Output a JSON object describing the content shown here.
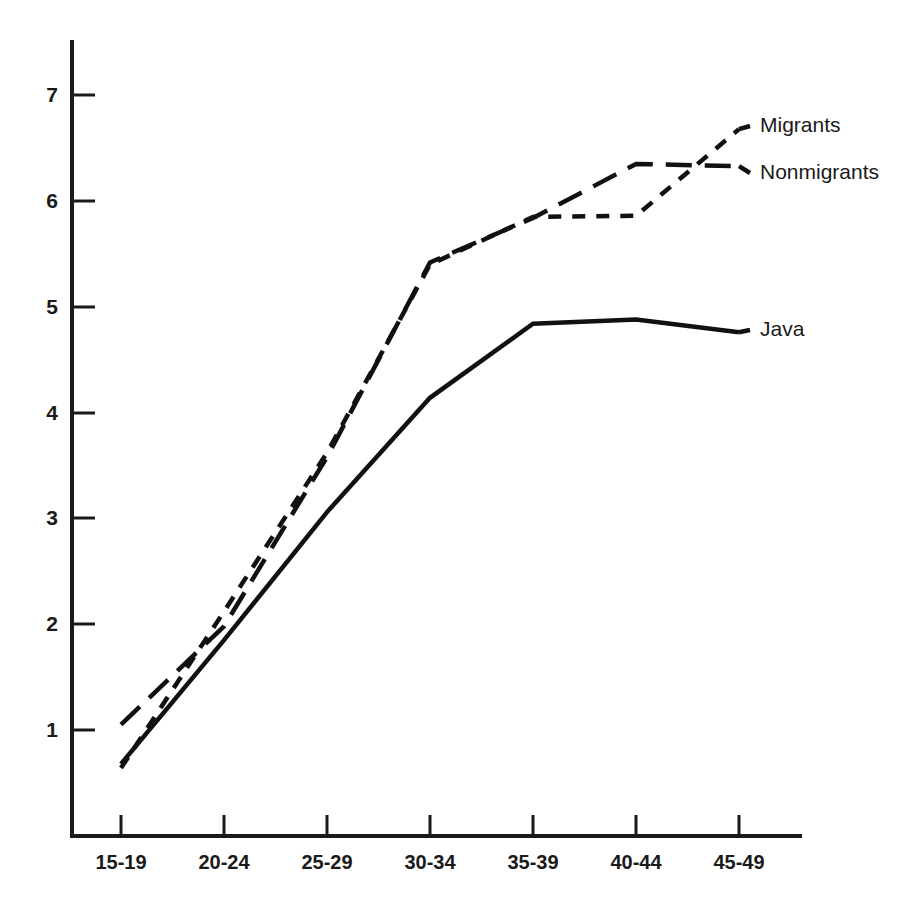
{
  "chart_data": {
    "type": "line",
    "title": "",
    "subtitle": "",
    "xlabel": "",
    "ylabel": "",
    "categories": [
      "15-19",
      "20-24",
      "25-29",
      "30-34",
      "35-39",
      "40-44",
      "45-49"
    ],
    "xlim": [
      0,
      6
    ],
    "ylim": [
      0,
      7.6
    ],
    "yticks": [
      1,
      2,
      3,
      4,
      5,
      6,
      7
    ],
    "ytick_labels": [
      "1",
      "2",
      "3",
      "4",
      "5",
      "6",
      "7"
    ],
    "grid": false,
    "legend_position": "right-inline-labels",
    "series": [
      {
        "name": "Migrants",
        "style": "short-dashed",
        "color": "#111111",
        "values": [
          0.64,
          2.12,
          3.62,
          5.4,
          5.85,
          5.86,
          6.68
        ]
      },
      {
        "name": "Nonmigrants",
        "style": "long-dashed",
        "color": "#111111",
        "values": [
          1.05,
          1.98,
          3.58,
          5.42,
          5.84,
          6.35,
          6.33
        ]
      },
      {
        "name": "Java",
        "style": "solid",
        "color": "#111111",
        "values": [
          0.68,
          1.85,
          3.06,
          4.14,
          4.84,
          4.88,
          4.76
        ]
      }
    ],
    "annotations": [
      {
        "text": "Migrants",
        "at_category": "45-49",
        "value": 6.68
      },
      {
        "text": "Nonmigrants",
        "at_category": "45-49",
        "value": 6.33
      },
      {
        "text": "Java",
        "at_category": "45-49",
        "value": 4.76
      }
    ]
  },
  "axes": {
    "y_tick_labels": [
      "7",
      "6",
      "5",
      "4",
      "3",
      "2",
      "1"
    ],
    "x_tick_labels": [
      "15-19",
      "20-24",
      "25-29",
      "30-34",
      "35-39",
      "40-44",
      "45-49"
    ]
  },
  "labels": {
    "migrants": "Migrants",
    "nonmigrants": "Nonmigrants",
    "java": "Java"
  }
}
